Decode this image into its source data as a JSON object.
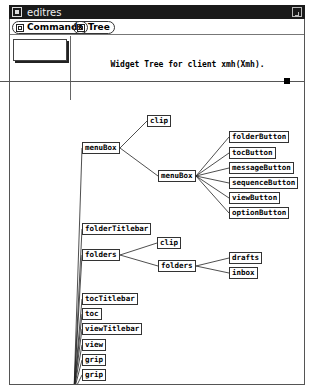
{
  "window": {
    "title": "editres",
    "menu_icon": "window-menu-icon",
    "resize_icon": "maximize-icon"
  },
  "menubar": {
    "buttons": [
      {
        "label": "Commands",
        "icon": "menu-icon"
      },
      {
        "label": "Tree",
        "icon": "menu-icon"
      }
    ]
  },
  "panel": {
    "message": "Widget Tree for client xmh(Xmh)."
  },
  "tree": {
    "nodes": [
      {
        "id": "clip1",
        "label": "clip",
        "x": 137,
        "y": 14
      },
      {
        "id": "menuBox1",
        "label": "menuBox",
        "x": 72,
        "y": 41
      },
      {
        "id": "menuBox2",
        "label": "menuBox",
        "x": 148,
        "y": 69
      },
      {
        "id": "folderButton",
        "label": "folderButton",
        "x": 219,
        "y": 30
      },
      {
        "id": "tocButton",
        "label": "tocButton",
        "x": 219,
        "y": 46
      },
      {
        "id": "messageButton",
        "label": "messageButton",
        "x": 219,
        "y": 61
      },
      {
        "id": "sequenceButton",
        "label": "sequenceButton",
        "x": 219,
        "y": 76
      },
      {
        "id": "viewButton",
        "label": "viewButton",
        "x": 219,
        "y": 91
      },
      {
        "id": "optionButton",
        "label": "optionButton",
        "x": 219,
        "y": 106
      },
      {
        "id": "folderTitlebar",
        "label": "folderTitlebar",
        "x": 72,
        "y": 122
      },
      {
        "id": "folders1",
        "label": "folders",
        "x": 72,
        "y": 148
      },
      {
        "id": "clip2",
        "label": "clip",
        "x": 147,
        "y": 136
      },
      {
        "id": "folders2",
        "label": "folders",
        "x": 148,
        "y": 159
      },
      {
        "id": "drafts",
        "label": "drafts",
        "x": 219,
        "y": 151
      },
      {
        "id": "inbox",
        "label": "inbox",
        "x": 219,
        "y": 166
      },
      {
        "id": "tocTitlebar",
        "label": "tocTitlebar",
        "x": 72,
        "y": 192
      },
      {
        "id": "toc",
        "label": "toc",
        "x": 72,
        "y": 207
      },
      {
        "id": "viewTitlebar",
        "label": "viewTitlebar",
        "x": 72,
        "y": 222
      },
      {
        "id": "view",
        "label": "view",
        "x": 72,
        "y": 238
      },
      {
        "id": "grip1",
        "label": "grip",
        "x": 72,
        "y": 253
      },
      {
        "id": "grip2",
        "label": "grip",
        "x": 72,
        "y": 268
      },
      {
        "id": "grip3",
        "label": "grip",
        "x": 72,
        "y": 283
      },
      {
        "id": "grip4",
        "label": "grip",
        "x": 72,
        "y": 298
      }
    ],
    "edges": [
      [
        "menuBox1",
        "clip1"
      ],
      [
        "menuBox1",
        "menuBox2"
      ],
      [
        "menuBox2",
        "folderButton"
      ],
      [
        "menuBox2",
        "tocButton"
      ],
      [
        "menuBox2",
        "messageButton"
      ],
      [
        "menuBox2",
        "sequenceButton"
      ],
      [
        "menuBox2",
        "viewButton"
      ],
      [
        "menuBox2",
        "optionButton"
      ],
      [
        "folders1",
        "clip2"
      ],
      [
        "folders1",
        "folders2"
      ],
      [
        "folders2",
        "drafts"
      ],
      [
        "folders2",
        "inbox"
      ]
    ]
  }
}
